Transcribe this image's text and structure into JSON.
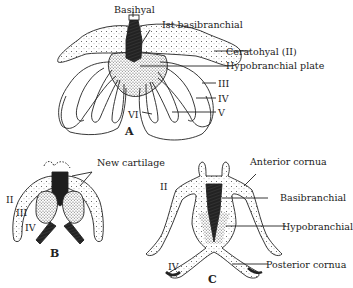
{
  "figure": {
    "panels": [
      {
        "id": "A",
        "label": "A",
        "labels": {
          "basihyal": "Basihyal",
          "basibranchial1": "Ist basibranchial",
          "ceratohyal": "Ceratohyal (II)",
          "hypobranchial_plate": "Hypobranchial plate",
          "arch3": "III",
          "arch4": "IV",
          "arch5": "V",
          "arch6": "VI"
        }
      },
      {
        "id": "B",
        "label": "B",
        "labels": {
          "new_cartilage": "New cartilage",
          "arch2": "II",
          "arch3": "III",
          "arch4": "IV"
        }
      },
      {
        "id": "C",
        "label": "C",
        "labels": {
          "anterior_cornua": "Anterior cornua",
          "basibranchial": "Basibranchial",
          "hypobranchial": "Hypobranchial",
          "posterior_cornua": "Posterior cornua",
          "arch2": "II",
          "arch4": "IV"
        }
      }
    ]
  }
}
